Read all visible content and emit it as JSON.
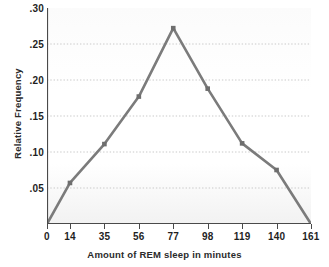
{
  "chart_data": {
    "type": "line",
    "title": "",
    "xlabel": "Amount of REM sleep in minutes",
    "ylabel": "Relative Frequency",
    "x": [
      0,
      14,
      35,
      56,
      77,
      98,
      119,
      140,
      161
    ],
    "values": [
      0,
      0.057,
      0.111,
      0.177,
      0.272,
      0.188,
      0.112,
      0.075,
      0
    ],
    "x_tick_labels": [
      "0",
      "14",
      "35",
      "56",
      "77",
      "98",
      "119",
      "140",
      "161"
    ],
    "y_tick_labels": [
      ".30",
      ".25",
      ".20",
      ".15",
      ".10",
      ".05"
    ],
    "y_tick_values": [
      0.3,
      0.25,
      0.2,
      0.15,
      0.1,
      0.05
    ],
    "xlim": [
      0,
      161
    ],
    "ylim": [
      0,
      0.3
    ],
    "grid": "horizontal-dotted",
    "legend": "none",
    "markers": [
      {
        "x": 14,
        "y": 0.057
      },
      {
        "x": 35,
        "y": 0.111
      },
      {
        "x": 56,
        "y": 0.177
      },
      {
        "x": 77,
        "y": 0.272
      },
      {
        "x": 98,
        "y": 0.188
      },
      {
        "x": 119,
        "y": 0.112
      },
      {
        "x": 140,
        "y": 0.075
      }
    ],
    "colors": {
      "line": "#7b7b7b",
      "marker": "#6e6e6e",
      "grid": "#c9c9c9",
      "axis": "#4a4a4a",
      "text": "#1f1f1f",
      "plot_background": "#fbfbfb"
    }
  }
}
